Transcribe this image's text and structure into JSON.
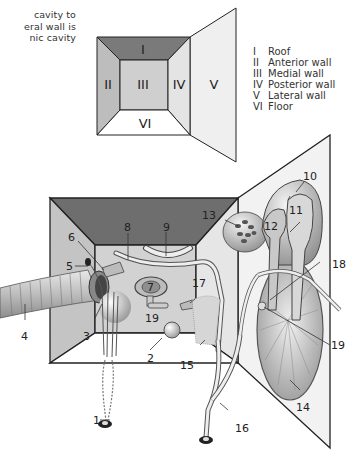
{
  "caption": {
    "lines": [
      "cavity to",
      "eral wall is",
      "nic cavity"
    ]
  },
  "schematic": {
    "walls": [
      {
        "numeral": "I",
        "name": "Roof"
      },
      {
        "numeral": "II",
        "name": "Anterior wall"
      },
      {
        "numeral": "III",
        "name": "Medial wall"
      },
      {
        "numeral": "IV",
        "name": "Posterior wall"
      },
      {
        "numeral": "V",
        "name": "Lateral wall"
      },
      {
        "numeral": "VI",
        "name": "Floor"
      }
    ],
    "colors": {
      "roof": "#7a7a7a",
      "anterior": "#bdbdbd",
      "medial": "#cfcfcf",
      "posterior": "#e2e2e2",
      "lateral": "#efefef",
      "floor": "#ffffff"
    }
  },
  "legend": [
    {
      "numeral": "I",
      "text": "Roof"
    },
    {
      "numeral": "II",
      "text": "Anterior wall"
    },
    {
      "numeral": "III",
      "text": "Medial wall"
    },
    {
      "numeral": "IV",
      "text": "Posterior wall"
    },
    {
      "numeral": "V",
      "text": "Lateral wall"
    },
    {
      "numeral": "VI",
      "text": "Floor"
    }
  ],
  "diagram_labels": {
    "l1": "1",
    "l2": "2",
    "l3": "3",
    "l4": "4",
    "l5": "5",
    "l6": "6",
    "l7": "7",
    "l8": "8",
    "l9": "9",
    "l10": "10",
    "l11": "11",
    "l12": "12",
    "l13": "13",
    "l14": "14",
    "l15": "15",
    "l16": "16",
    "l17": "17",
    "l18": "18",
    "l19a": "19",
    "l19b": "19"
  }
}
